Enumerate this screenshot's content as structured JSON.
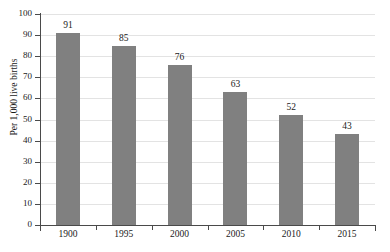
{
  "chart_data": {
    "type": "bar",
    "title": "",
    "xlabel": "",
    "ylabel": "Per 1,000 live births",
    "categories": [
      "1900",
      "1995",
      "2000",
      "2005",
      "2010",
      "2015"
    ],
    "values": [
      91,
      85,
      76,
      63,
      52,
      43
    ],
    "ylim": [
      0,
      100
    ],
    "ytick_step": 10,
    "yticks": [
      "0",
      "10",
      "20",
      "30",
      "40",
      "50",
      "60",
      "70",
      "80",
      "90",
      "100"
    ],
    "grid": true,
    "grid_axis": "y",
    "legend": false,
    "legend_position": "none",
    "bar_color": "#808080",
    "gridline_color": "#e3e3e3",
    "axis_color": "#4a4a4a",
    "text_color": "#1a1a1a",
    "background": "#ffffff",
    "data_labels": [
      "91",
      "85",
      "76",
      "63",
      "52",
      "43"
    ]
  }
}
